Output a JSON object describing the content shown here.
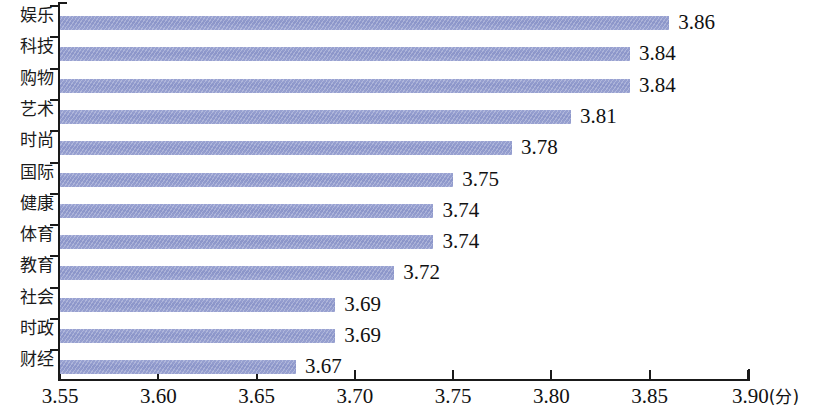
{
  "chart_data": {
    "type": "bar",
    "orientation": "horizontal",
    "title": "",
    "subtitle": "",
    "xlabel": "(分)",
    "ylabel": "",
    "xlim": [
      3.55,
      3.9
    ],
    "grid": false,
    "legend": null,
    "axis_unit": "(分)",
    "xticks": [
      "3.55",
      "3.60",
      "3.65",
      "3.70",
      "3.75",
      "3.80",
      "3.85",
      "3.90"
    ],
    "xtick_values": [
      3.55,
      3.6,
      3.65,
      3.7,
      3.75,
      3.8,
      3.85,
      3.9
    ],
    "bar_color": "#8b95c9",
    "categories": [
      "娱乐",
      "科技",
      "购物",
      "艺术",
      "时尚",
      "国际",
      "健康",
      "体育",
      "教育",
      "社会",
      "时政",
      "财经"
    ],
    "values": [
      3.86,
      3.84,
      3.84,
      3.81,
      3.78,
      3.75,
      3.74,
      3.74,
      3.72,
      3.69,
      3.69,
      3.67
    ],
    "data_labels": [
      "3.86",
      "3.84",
      "3.84",
      "3.81",
      "3.78",
      "3.75",
      "3.74",
      "3.74",
      "3.72",
      "3.69",
      "3.69",
      "3.67"
    ],
    "items": [
      {
        "label": "娱乐",
        "value": 3.86,
        "display": "3.86"
      },
      {
        "label": "科技",
        "value": 3.84,
        "display": "3.84"
      },
      {
        "label": "购物",
        "value": 3.84,
        "display": "3.84"
      },
      {
        "label": "艺术",
        "value": 3.81,
        "display": "3.81"
      },
      {
        "label": "时尚",
        "value": 3.78,
        "display": "3.78"
      },
      {
        "label": "国际",
        "value": 3.75,
        "display": "3.75"
      },
      {
        "label": "健康",
        "value": 3.74,
        "display": "3.74"
      },
      {
        "label": "体育",
        "value": 3.74,
        "display": "3.74"
      },
      {
        "label": "教育",
        "value": 3.72,
        "display": "3.72"
      },
      {
        "label": "社会",
        "value": 3.69,
        "display": "3.69"
      },
      {
        "label": "时政",
        "value": 3.69,
        "display": "3.69"
      },
      {
        "label": "财经",
        "value": 3.67,
        "display": "3.67"
      }
    ]
  }
}
